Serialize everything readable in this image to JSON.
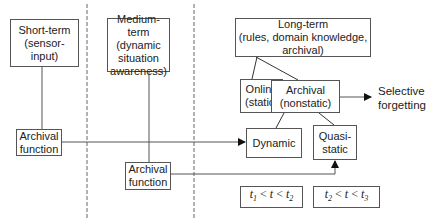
{
  "diagram": {
    "type": "memory-model-flow",
    "columns": [
      "short-term",
      "medium-term",
      "long-term"
    ],
    "nodes": {
      "short_term": {
        "line1": "Short-term",
        "line2": "(sensor-input)"
      },
      "medium_term": {
        "line1": "Medium-term",
        "line2": "(dynamic",
        "line3": "situation",
        "line4": "awareness)"
      },
      "long_term": {
        "line1": "Long-term",
        "line2": "(rules, domain knowledge, archival)"
      },
      "online": {
        "line1": "Online",
        "line2": "(static)"
      },
      "archival_nonstatic": {
        "line1": "Archival",
        "line2": "(nonstatic)"
      },
      "selective_forgetting": {
        "line1": "Selective",
        "line2": "forgetting"
      },
      "dynamic": {
        "label": "Dynamic"
      },
      "quasi_static": {
        "line1": "Quasi-",
        "line2": "static"
      },
      "archival_function_1": {
        "line1": "Archival",
        "line2": "function"
      },
      "archival_function_2": {
        "line1": "Archival",
        "line2": "function"
      },
      "interval_1": {
        "t_a": "t",
        "sub_a": "1",
        "lt1": " < ",
        "t": "t",
        "lt2": " < ",
        "t_b": "t",
        "sub_b": "2"
      },
      "interval_2": {
        "t_a": "t",
        "sub_a": "2",
        "lt1": " < ",
        "t": "t",
        "lt2": " < ",
        "t_b": "t",
        "sub_b": "3"
      }
    },
    "edges": [
      {
        "from": "short_term",
        "to": "archival_function_1",
        "arrow": false
      },
      {
        "from": "archival_function_1",
        "to": "dynamic",
        "arrow": true
      },
      {
        "from": "medium_term",
        "to": "archival_function_2",
        "arrow": false
      },
      {
        "from": "archival_function_2",
        "to": "quasi_static",
        "arrow": true
      },
      {
        "from": "long_term",
        "to": "online",
        "arrow": false
      },
      {
        "from": "long_term",
        "to": "archival_nonstatic",
        "arrow": false
      },
      {
        "from": "archival_nonstatic",
        "to": "dynamic",
        "arrow": false
      },
      {
        "from": "archival_nonstatic",
        "to": "quasi_static",
        "arrow": false
      },
      {
        "from": "archival_nonstatic",
        "to": "selective_forgetting",
        "arrow": true
      }
    ],
    "colors": {
      "line": "#555555",
      "text": "#222222",
      "background": "#ffffff"
    }
  }
}
